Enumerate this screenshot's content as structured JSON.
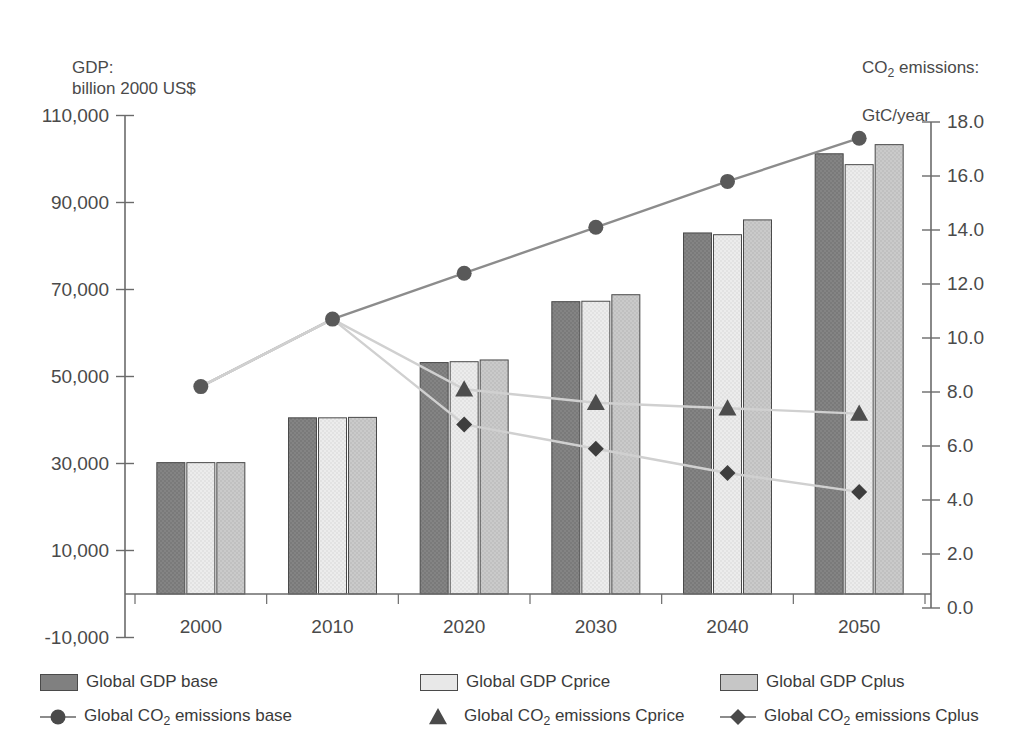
{
  "chart_data": {
    "type": "bar",
    "title": "",
    "left_axis_caption": "GDP:\nbillion 2000 US$",
    "right_axis_caption_pre": "CO",
    "right_axis_caption_sub": "2",
    "right_axis_caption_post": " emissions:",
    "right_axis_caption_line2": "GtC/year",
    "xlabel": "",
    "ylabel": "GDP: billion 2000 US$",
    "y2label": "CO2 emissions: GtC/year",
    "categories": [
      "2000",
      "2010",
      "2020",
      "2030",
      "2040",
      "2050"
    ],
    "ylim": [
      -10000,
      110000
    ],
    "yticks": [
      "-10,000",
      "10,000",
      "30,000",
      "50,000",
      "70,000",
      "90,000",
      "110,000"
    ],
    "ytick_values": [
      -10000,
      10000,
      30000,
      50000,
      70000,
      90000,
      110000
    ],
    "y2lim": [
      0,
      18
    ],
    "y2ticks": [
      "0.0",
      "2.0",
      "4.0",
      "6.0",
      "8.0",
      "10.0",
      "12.0",
      "14.0",
      "16.0",
      "18.0"
    ],
    "y2tick_values": [
      0,
      2,
      4,
      6,
      8,
      10,
      12,
      14,
      16,
      18
    ],
    "grid": false,
    "legend_position": "bottom",
    "bar_series": [
      {
        "name": "Global GDP base",
        "key": "gdp_base",
        "color": "#808080",
        "edge": "#4a4a4a",
        "values": [
          30200,
          40500,
          53200,
          67200,
          83000,
          101200
        ]
      },
      {
        "name": "Global GDP Cprice",
        "key": "gdp_cprice",
        "color": "#e8e8e8",
        "edge": "#4a4a4a",
        "values": [
          30200,
          40500,
          53400,
          67300,
          82600,
          98700
        ]
      },
      {
        "name": "Global GDP Cplus",
        "key": "gdp_cplus",
        "color": "#c6c6c6",
        "edge": "#4a4a4a",
        "values": [
          30200,
          40600,
          53800,
          68800,
          86000,
          103300
        ]
      }
    ],
    "line_series": [
      {
        "name": "Global CO2 emissions base",
        "name_pre": "Global CO",
        "name_sub": "2",
        "name_post": " emissions base",
        "key": "co2_base",
        "marker": "circle",
        "color": "#595959",
        "line_color": "#8c8c8c",
        "values": [
          8.2,
          10.7,
          12.4,
          14.1,
          15.8,
          17.4
        ]
      },
      {
        "name": "Global CO2 emissions Cprice",
        "name_pre": "Global CO",
        "name_sub": "2",
        "name_post": " emissions Cprice",
        "key": "co2_cprice",
        "marker": "triangle",
        "color": "#4d4d4d",
        "line_color": "#d0d0d0",
        "values": [
          8.2,
          10.7,
          8.1,
          7.6,
          7.4,
          7.2
        ]
      },
      {
        "name": "Global CO2 emissions Cplus",
        "name_pre": "Global CO",
        "name_sub": "2",
        "name_post": " emissions Cplus",
        "key": "co2_cplus",
        "marker": "diamond",
        "color": "#3d3d3d",
        "line_color": "#d0d0d0",
        "values": [
          8.2,
          10.7,
          6.8,
          5.9,
          5.0,
          4.3
        ]
      }
    ]
  },
  "legend": {
    "row1": [
      {
        "label": "Global GDP base",
        "swatch": "#808080"
      },
      {
        "label": "Global GDP Cprice",
        "swatch": "#e8e8e8"
      },
      {
        "label": "Global GDP Cplus",
        "swatch": "#c6c6c6"
      }
    ],
    "row2": [
      {
        "pre": "Global CO",
        "sub": "2",
        "post": " emissions base",
        "marker": "circle"
      },
      {
        "pre": "Global CO",
        "sub": "2",
        "post": " emissions Cprice",
        "marker": "triangle"
      },
      {
        "pre": "Global CO",
        "sub": "2",
        "post": " emissions Cplus",
        "marker": "diamond"
      }
    ]
  }
}
